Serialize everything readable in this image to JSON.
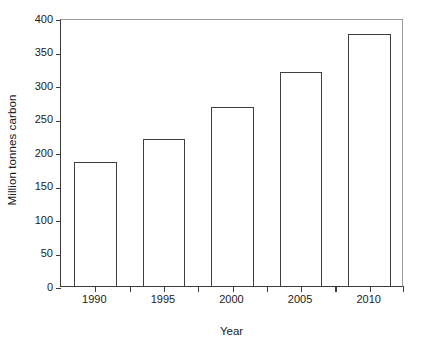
{
  "chart_data": {
    "type": "bar",
    "title": "",
    "subtitle": "",
    "categories": [
      "1990",
      "1995",
      "2000",
      "2005",
      "2010"
    ],
    "values": [
      185,
      220,
      267,
      320,
      376
    ],
    "xlabel": "Year",
    "ylabel": "Million tonnes carbon",
    "ylim": [
      0,
      400
    ],
    "y_ticks": [
      0,
      50,
      100,
      150,
      200,
      250,
      300,
      350,
      400
    ],
    "y_tick_labels": [
      "0",
      "50",
      "100",
      "150",
      "200",
      "250",
      "300",
      "350",
      "400"
    ],
    "grid": false,
    "legend": null,
    "legend_position": "none",
    "annotations": [],
    "series": [
      {
        "name": "Million tonnes carbon",
        "values": [
          185,
          220,
          267,
          320,
          376
        ]
      }
    ],
    "style": {
      "bar_fill": "#ffffff",
      "bar_outline": "#3f3f3f",
      "axis_color": "#3b3b3b",
      "frame_color": "#9a9a9a",
      "text_color": "#1a1a1a",
      "background": "#ffffff",
      "bar_width_ratio": 0.62
    }
  }
}
